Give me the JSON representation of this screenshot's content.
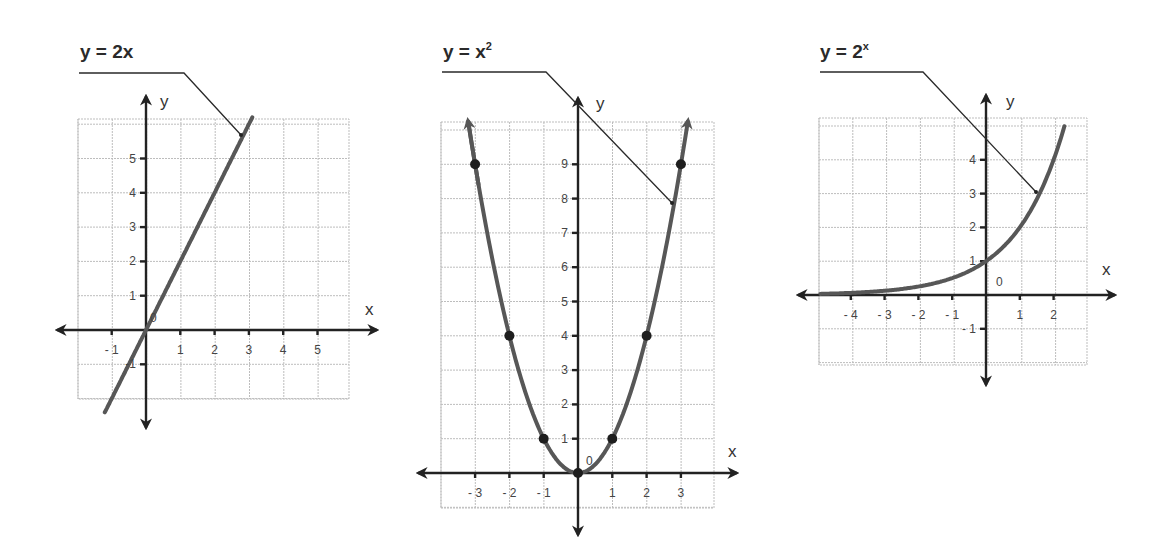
{
  "chart_data": [
    {
      "type": "line",
      "title": "y = 2x",
      "title_parts": {
        "base": "y = 2x",
        "sup": ""
      },
      "function": "2x",
      "xlabel": "x",
      "ylabel": "y",
      "origin_label": "0",
      "xlim": [
        -2,
        6
      ],
      "ylim": [
        -2,
        6
      ],
      "x_ticks": [
        -1,
        1,
        2,
        3,
        4,
        5
      ],
      "x_tick_labels": [
        "- 1",
        "1",
        "2",
        "3",
        "4",
        "5"
      ],
      "y_ticks": [
        -1,
        1,
        2,
        3,
        4,
        5
      ],
      "y_tick_labels": [
        "-1",
        "1",
        "2",
        "3",
        "4",
        "5"
      ],
      "grid": true,
      "x": [
        -1.2,
        0,
        1,
        2,
        3.1
      ],
      "y": [
        -2.4,
        0,
        2,
        4,
        6.2
      ],
      "marked_points": [],
      "line_color": "#575757",
      "layout": {
        "origin_px": [
          146,
          330
        ],
        "unit_px": 34.3,
        "grid_px": {
          "left": 78,
          "top": 119,
          "right": 349,
          "bottom": 399
        },
        "x_axis_px": [
          57,
          377
        ],
        "y_axis_px": [
          96,
          428
        ],
        "curve_x_range": [
          -1.2,
          3.1
        ],
        "title_px": [
          80,
          58
        ],
        "leader_px": [
          [
            79,
            73
          ],
          [
            184,
            73
          ],
          [
            241,
            135
          ]
        ],
        "xlabel_px": [
          365,
          315
        ],
        "ylabel_px": [
          160,
          107
        ],
        "origin_label_px": [
          150,
          322
        ]
      }
    },
    {
      "type": "line",
      "title": "y = x²",
      "title_parts": {
        "base": "y = x",
        "sup": "2"
      },
      "function": "x^2",
      "xlabel": "x",
      "ylabel": "y",
      "origin_label": "0",
      "xlim": [
        -4,
        4
      ],
      "ylim": [
        -1,
        10
      ],
      "x_ticks": [
        -3,
        -2,
        -1,
        1,
        2,
        3
      ],
      "x_tick_labels": [
        "- 3",
        "- 2",
        "- 1",
        "1",
        "2",
        "3"
      ],
      "y_ticks": [
        1,
        2,
        3,
        4,
        5,
        6,
        7,
        8,
        9
      ],
      "y_tick_labels": [
        "1",
        "2",
        "3",
        "4",
        "5",
        "6",
        "7",
        "8",
        "9"
      ],
      "grid": true,
      "x": [
        -3,
        -2,
        -1,
        0,
        1,
        2,
        3
      ],
      "y": [
        9,
        4,
        1,
        0,
        1,
        4,
        9
      ],
      "marked_points": [
        [
          -3,
          9
        ],
        [
          -2,
          4
        ],
        [
          -1,
          1
        ],
        [
          0,
          0
        ],
        [
          1,
          1
        ],
        [
          2,
          4
        ],
        [
          3,
          9
        ]
      ],
      "line_color": "#575757",
      "layout": {
        "origin_px": [
          578,
          473
        ],
        "unit_px": 34.3,
        "grid_px": {
          "left": 441,
          "top": 122,
          "right": 714,
          "bottom": 508
        },
        "x_axis_px": [
          418,
          737
        ],
        "y_axis_px": [
          98,
          535
        ],
        "curve_x_range": [
          -3.2,
          3.2
        ],
        "title_px": [
          443,
          58
        ],
        "leader_px": [
          [
            442,
            72
          ],
          [
            546,
            72
          ],
          [
            672,
            203
          ]
        ],
        "xlabel_px": [
          728,
          457
        ],
        "ylabel_px": [
          596,
          109
        ],
        "origin_label_px": [
          586,
          465
        ]
      }
    },
    {
      "type": "line",
      "title": "y = 2ˣ",
      "title_parts": {
        "base": "y = 2",
        "sup": "x"
      },
      "function": "2^x",
      "xlabel": "x",
      "ylabel": "y",
      "origin_label": "0",
      "xlim": [
        -5,
        3
      ],
      "ylim": [
        -2,
        5
      ],
      "x_ticks": [
        -4,
        -3,
        -2,
        -1,
        1,
        2
      ],
      "x_tick_labels": [
        "- 4",
        "- 3",
        "- 2",
        "- 1",
        "1",
        "2"
      ],
      "y_ticks": [
        -1,
        1,
        2,
        3,
        4
      ],
      "y_tick_labels": [
        "- 1",
        "1",
        "2",
        "3",
        "4"
      ],
      "grid": true,
      "x": [
        -4.9,
        -4,
        -3,
        -2,
        -1,
        0,
        1,
        2,
        2.3
      ],
      "y": [
        0.03,
        0.0625,
        0.125,
        0.25,
        0.5,
        1,
        2,
        4,
        4.92
      ],
      "marked_points": [],
      "line_color": "#575757",
      "layout": {
        "origin_px": [
          986,
          295
        ],
        "unit_px": 33.8,
        "grid_px": {
          "left": 819,
          "top": 118,
          "right": 1087,
          "bottom": 365
        },
        "x_axis_px": [
          798,
          1115
        ],
        "y_axis_px": [
          95,
          385
        ],
        "curve_x_range": [
          -4.9,
          2.32
        ],
        "title_px": [
          820,
          58
        ],
        "leader_px": [
          [
            820,
            72
          ],
          [
            923,
            72
          ],
          [
            1036,
            192
          ]
        ],
        "xlabel_px": [
          1102,
          275
        ],
        "ylabel_px": [
          1006,
          107
        ],
        "origin_label_px": [
          996,
          286
        ]
      }
    }
  ]
}
